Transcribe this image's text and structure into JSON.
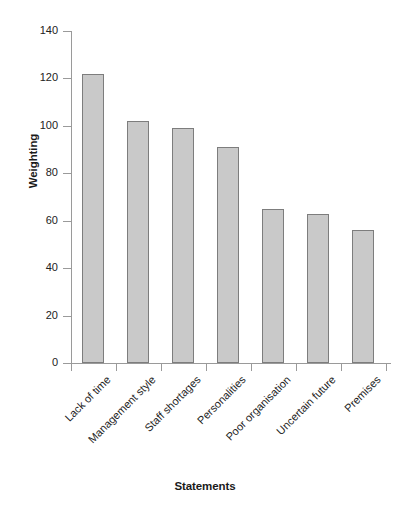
{
  "chart_data": {
    "type": "bar",
    "title": "",
    "xlabel": "Statements",
    "ylabel": "Weighting",
    "categories": [
      "Lack of time",
      "Management style",
      "Staff shortages",
      "Personalities",
      "Poor organisation",
      "Uncertain future",
      "Premises"
    ],
    "values": [
      122,
      102,
      99,
      91,
      65,
      63,
      56
    ],
    "ylim": [
      0,
      140
    ],
    "ytick_values": [
      0,
      20,
      40,
      60,
      80,
      100,
      120,
      140
    ],
    "ytick_labels": [
      "0",
      "20",
      "40",
      "60",
      "80",
      "100",
      "120",
      "140"
    ],
    "grid": false,
    "legend": null,
    "bar_fill_color": "#c9c9c9",
    "bar_edge_color": "#7d7d7d",
    "axis_color": "#9a9a9a",
    "text_color": "#222222"
  }
}
